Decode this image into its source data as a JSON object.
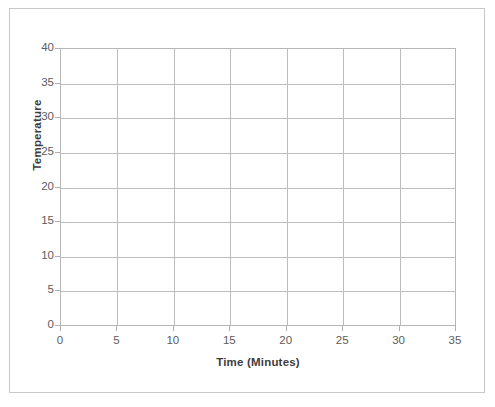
{
  "scan": {
    "top_artifact_text": ""
  },
  "chart_data": {
    "type": "line",
    "title": "",
    "subtitle": "",
    "xlabel": "Time (Minutes)",
    "ylabel": "Temperature",
    "xlim": [
      0,
      35
    ],
    "ylim": [
      0,
      40
    ],
    "x_ticks": [
      0,
      5,
      10,
      15,
      20,
      25,
      30,
      35
    ],
    "y_ticks": [
      0,
      5,
      10,
      15,
      20,
      25,
      30,
      35,
      40
    ],
    "x_tick_labels": [
      "0",
      "5",
      "10",
      "15",
      "20",
      "25",
      "30",
      "35"
    ],
    "y_tick_labels": [
      "0",
      "5",
      "10",
      "15",
      "20",
      "25",
      "30",
      "35",
      "40"
    ],
    "x_tick_interval": 5,
    "y_tick_interval": 5,
    "grid": true,
    "grid_axes": "both",
    "legend": false,
    "legend_position": "none",
    "series": [],
    "values": [],
    "categories": [],
    "annotations": [],
    "note": "Blank graph template: axes and gridlines only, no plotted data."
  },
  "style": {
    "background_color": "#ffffff",
    "frame_border_color": "#c9c9c9",
    "plot_border_color": "#b6b6b6",
    "gridline_color": "#bdbdbd",
    "tick_label_color": "#5c5c5c",
    "axis_title_color": "#3d3d3d"
  }
}
